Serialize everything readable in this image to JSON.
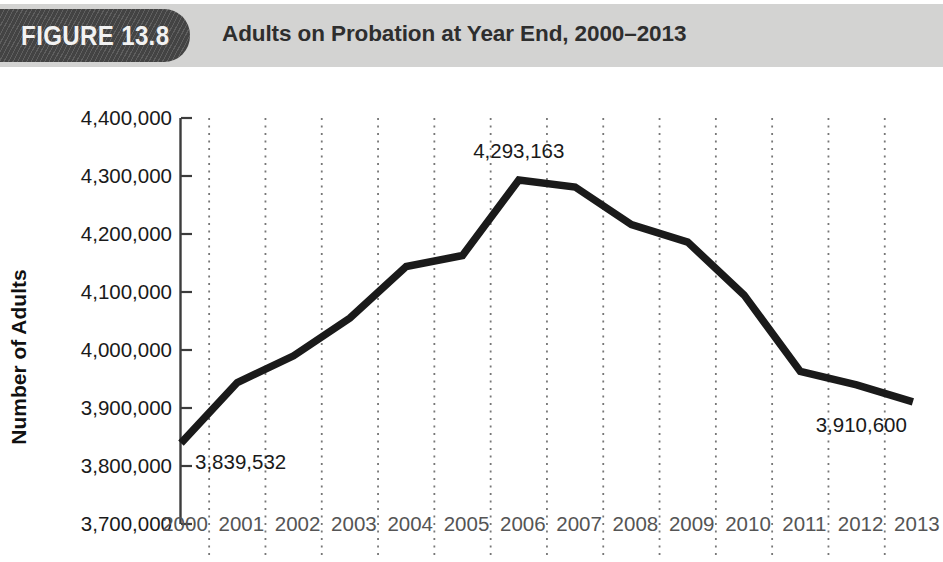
{
  "header": {
    "figure_badge": "FIGURE 13.8",
    "title": "Adults on Probation at Year End, 2000–2013",
    "bar_color": "#d3d3d2",
    "badge_color": "#4b4b4b"
  },
  "chart_data": {
    "type": "line",
    "title": "Adults on Probation at Year End, 2000–2013",
    "xlabel": "",
    "ylabel": "Number of Adults",
    "categories": [
      "2000",
      "2001",
      "2002",
      "2003",
      "2004",
      "2005",
      "2006",
      "2007",
      "2008",
      "2009",
      "2010",
      "2011",
      "2012",
      "2013"
    ],
    "values": [
      3839532,
      3944000,
      3990000,
      4055000,
      4144000,
      4163000,
      4293163,
      4281000,
      4216000,
      4186000,
      4095000,
      3963000,
      3940000,
      3910600
    ],
    "series": [
      {
        "name": "Adults on probation",
        "values": [
          3839532,
          3944000,
          3990000,
          4055000,
          4144000,
          4163000,
          4293163,
          4281000,
          4216000,
          4186000,
          4095000,
          3963000,
          3940000,
          3910600
        ]
      }
    ],
    "ylim": [
      3700000,
      4400000
    ],
    "ytick_labels": [
      "4,400,000",
      "4,300,000",
      "4,200,000",
      "4,100,000",
      "4,000,000",
      "3,900,000",
      "3,800,000",
      "3,700,000"
    ],
    "ytick_values": [
      4400000,
      4300000,
      4200000,
      4100000,
      4000000,
      3900000,
      3800000,
      3700000
    ],
    "grid": "vertical-dotted-between-categories",
    "legend": "none",
    "line_color": "#1a1a1a",
    "annotations": [
      {
        "label": "3,839,532",
        "category": "2000",
        "value": 3839532
      },
      {
        "label": "4,293,163",
        "category": "2006",
        "value": 4293163
      },
      {
        "label": "3,910,600",
        "category": "2013",
        "value": 3910600
      }
    ]
  }
}
